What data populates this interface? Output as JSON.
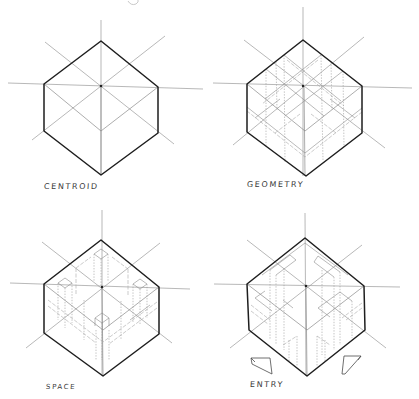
{
  "figure": {
    "title_partial": "g",
    "panels": [
      {
        "id": "centroid",
        "label": "CENTROID",
        "hexagon": {
          "top": [
            101,
            41
          ],
          "left_top": [
            44,
            84
          ],
          "right_top": [
            158,
            87
          ],
          "left_bottom": [
            44,
            131
          ],
          "right_bottom": [
            158,
            133
          ],
          "bottom": [
            101,
            175
          ],
          "center": [
            101,
            86
          ],
          "inner_corner": [
            101,
            131
          ]
        }
      },
      {
        "id": "geometry",
        "label": "GEOMETRY",
        "hexagon": {
          "top": [
            303,
            40
          ],
          "left_top": [
            247,
            84
          ],
          "right_top": [
            362,
            86
          ],
          "left_bottom": [
            247,
            132
          ],
          "right_bottom": [
            362,
            133
          ],
          "bottom": [
            306,
            176
          ],
          "center": [
            303,
            86
          ],
          "inner_corner": [
            305,
            131
          ]
        }
      },
      {
        "id": "space",
        "label": "SPACE",
        "hexagon": {
          "top": [
            101,
            240
          ],
          "left_top": [
            44,
            284
          ],
          "right_top": [
            159,
            287
          ],
          "left_bottom": [
            44,
            333
          ],
          "right_bottom": [
            159,
            334
          ],
          "bottom": [
            103,
            376
          ],
          "center": [
            102,
            287
          ],
          "inner_corner": [
            103,
            330
          ]
        }
      },
      {
        "id": "entry",
        "label": "ENTRY",
        "hexagon": {
          "top": [
            305,
            238
          ],
          "left_top": [
            247,
            284
          ],
          "right_top": [
            364,
            286
          ],
          "left_bottom": [
            249,
            330
          ],
          "right_bottom": [
            365,
            330
          ],
          "bottom": [
            307,
            376
          ],
          "center": [
            306,
            286
          ],
          "inner_corner": [
            307,
            330
          ]
        },
        "entry_markers": [
          {
            "name": "left-entry-marker",
            "points": [
              [
                251,
                358
              ],
              [
                270,
                358
              ],
              [
                272,
                374
              ],
              [
                252,
                364
              ]
            ]
          },
          {
            "name": "right-entry-marker",
            "points": [
              [
                344,
                356
              ],
              [
                361,
                356
              ],
              [
                345,
                374
              ],
              [
                342,
                374
              ]
            ]
          }
        ]
      }
    ]
  }
}
